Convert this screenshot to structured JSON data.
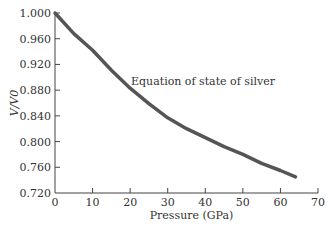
{
  "chart_data": {
    "type": "line",
    "title": "",
    "annotation": "Equation of state of silver",
    "xlabel": "Pressure (GPa)",
    "ylabel": "V/V0",
    "xlim": [
      0,
      70
    ],
    "ylim": [
      0.72,
      1.0
    ],
    "xticks": [
      "0",
      "10",
      "20",
      "30",
      "40",
      "50",
      "60",
      "70"
    ],
    "yticks": [
      "0.720",
      "0.760",
      "0.800",
      "0.840",
      "0.880",
      "0.920",
      "0.960",
      "1.000"
    ],
    "grid": false,
    "series": [
      {
        "name": "Equation of state of silver",
        "x": [
          0,
          5,
          10,
          15,
          20,
          25,
          30,
          35,
          40,
          45,
          50,
          55,
          60,
          64
        ],
        "values": [
          1.0,
          0.968,
          0.942,
          0.911,
          0.883,
          0.859,
          0.837,
          0.82,
          0.806,
          0.792,
          0.78,
          0.766,
          0.755,
          0.745
        ]
      }
    ],
    "color": "#555555"
  }
}
